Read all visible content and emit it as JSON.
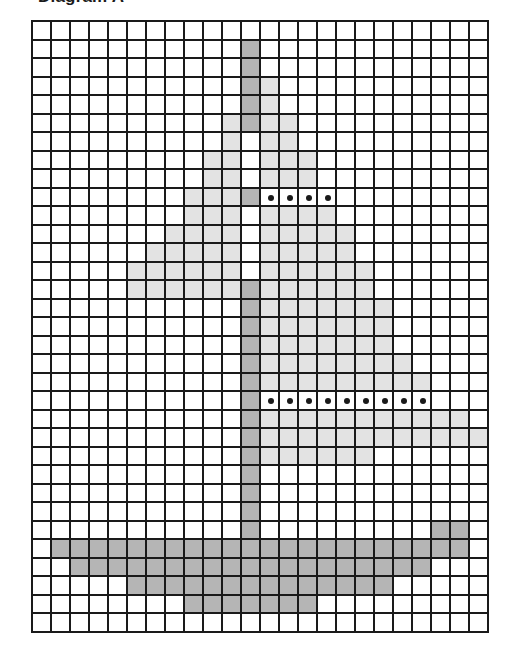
{
  "title": "Diagram A",
  "grid": {
    "columns": 24,
    "rows": 33,
    "legend": {
      ".": "white",
      "L": "light-grey",
      "D": "dark-grey",
      "o": "dot"
    },
    "colors": {
      "white": "#ffffff",
      "light-grey": "#e3e3e3",
      "dark-grey": "#b5b5b5",
      "lines": "#1a1a1a",
      "dot": "#1a1a1a"
    },
    "cells": [
      "........................",
      "...........D............",
      "...........D............",
      "...........DL...........",
      "...........DL...........",
      "..........LDLL..........",
      "..........L.LL..........",
      ".........LL.LLL.........",
      ".........LL.LLL.........",
      "........LLLDoooo........",
      "........LLL.LLLL........",
      ".......LLLL.LLLLL.......",
      "......LLLLL.LLLLL.......",
      ".....LLLLLL.LLLLLL......",
      ".....LLLLLLDLLLLLL......",
      "...........DLLLLLLL.....",
      "...........DLLLLLLL.....",
      "...........DLLLLLLL.....",
      "...........DLLLLLLLL....",
      "...........DLLLLLLLLL...",
      "...........Dooooooooo...",
      "...........DLLLLLLLLLLL.",
      "...........DLLLLLLLLLLLL",
      "...........DLLLLLL......",
      "...........D............",
      "...........D............",
      "...........D............",
      "...........D.........DD.",
      ".DDDDDDDDDDDDDDDDDDDDDD.",
      "..DDDDDDDDDDDDDDDDDDD...",
      ".....DDDDDDDDDDDDDD.....",
      "........DDDDDDD.........",
      "........................"
    ]
  }
}
